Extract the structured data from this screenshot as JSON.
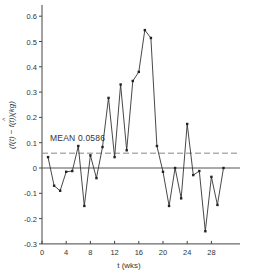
{
  "chart_data": {
    "type": "line",
    "title": "",
    "xlabel": "t (wks)",
    "ylabel": "(f(t) − f̂(t))(kg)",
    "xlim": [
      0,
      33
    ],
    "ylim": [
      -0.3,
      0.63
    ],
    "xticks": [
      0,
      4,
      8,
      12,
      16,
      20,
      24,
      28
    ],
    "xtick_labels": [
      "0",
      "4",
      "8",
      "12",
      "16",
      "20",
      "24",
      "28"
    ],
    "yticks": [
      -0.3,
      -0.2,
      -0.1,
      0,
      0.1,
      0.2,
      0.3,
      0.4,
      0.5,
      0.6
    ],
    "ytick_labels": [
      "-0.3",
      "-0.2",
      "-0.1",
      "0",
      "0.1",
      "0.2",
      "0.3",
      "0.4",
      "0.5",
      "0.6"
    ],
    "grid": false,
    "legend": null,
    "series": [
      {
        "name": "residual",
        "x": [
          1,
          2,
          3,
          4,
          5,
          6,
          7,
          8,
          9,
          10,
          11,
          12,
          13,
          14,
          15,
          16,
          17,
          18,
          19,
          20,
          21,
          22,
          23,
          24,
          25,
          26,
          27,
          28,
          29,
          30
        ],
        "values": [
          0.043,
          -0.07,
          -0.09,
          -0.015,
          -0.012,
          0.087,
          -0.15,
          0.05,
          -0.04,
          0.083,
          0.277,
          0.043,
          0.33,
          0.07,
          0.344,
          0.38,
          0.545,
          0.514,
          0.087,
          -0.015,
          -0.15,
          0.0,
          -0.12,
          0.174,
          -0.028,
          -0.012,
          -0.25,
          -0.035,
          -0.146,
          0.0
        ]
      }
    ],
    "reference_lines": [
      {
        "name": "zero",
        "y": 0,
        "style": "solid"
      },
      {
        "name": "mean",
        "y": 0.0586,
        "style": "dashed"
      }
    ],
    "annotations": [
      {
        "text": "MEAN 0.0586",
        "x": 1.3,
        "y": 0.12
      }
    ]
  },
  "labels": {
    "xlabel": "t (wks)",
    "mean": "MEAN 0.0586"
  }
}
